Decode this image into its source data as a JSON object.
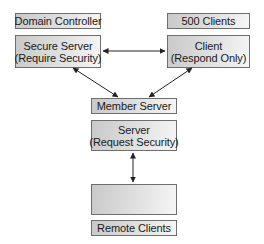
{
  "diagram": {
    "left": {
      "label": "Domain Controller",
      "node_line1": "Secure Server",
      "node_line2": "(Require Security)"
    },
    "right": {
      "label": "500 Clients",
      "node_line1": "Client",
      "node_line2": "(Respond Only)"
    },
    "center": {
      "label": "Member Server",
      "node_line1": "Server",
      "node_line2": "(Request Security)"
    },
    "bottom": {
      "node_text": "",
      "label": "Remote Clients"
    },
    "connections": [
      {
        "from": "Secure Server (Require Security)",
        "to": "Client (Respond Only)",
        "type": "bidirectional"
      },
      {
        "from": "Secure Server (Require Security)",
        "to": "Member Server",
        "type": "bidirectional"
      },
      {
        "from": "Client (Respond Only)",
        "to": "Member Server",
        "type": "bidirectional"
      },
      {
        "from": "Server (Request Security)",
        "to": "Remote Clients node",
        "type": "bidirectional"
      }
    ],
    "colors": {
      "border": "#6e6e6e",
      "fill_dark": "#c9c9c9",
      "fill_light": "#f6f6f6",
      "arrow": "#222222"
    }
  }
}
